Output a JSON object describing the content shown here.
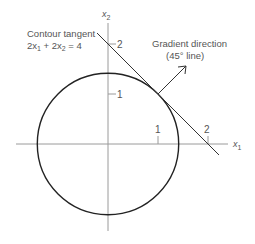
{
  "figure": {
    "axes": {
      "x_label": "x",
      "x_sub": "1",
      "y_label": "x",
      "y_sub": "2",
      "x_ticks": [
        "1",
        "2"
      ],
      "y_ticks": [
        "1",
        "2"
      ]
    },
    "annotations": {
      "contour_title": "Contour tangent",
      "contour_eq_a": "2x",
      "contour_eq_a_sub": "1",
      "contour_eq_mid": " + 2x",
      "contour_eq_b_sub": "2",
      "contour_eq_end": " = 4",
      "gradient_title": "Gradient direction",
      "gradient_sub": "(45° line)"
    },
    "geometry": {
      "circle": "x1^2 + x2^2 = 2",
      "tangent_line": "x1 + x2 = 2",
      "tangent_point": [
        1,
        1
      ],
      "gradient_angle_deg": 45
    }
  }
}
